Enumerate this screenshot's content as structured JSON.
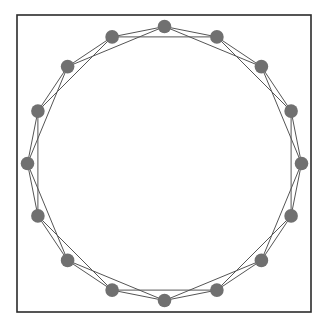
{
  "figure": {
    "title": "",
    "background_color": "#ffffff"
  },
  "frame": {
    "name": "plot-frame",
    "x": 17,
    "y": 15,
    "width": 294,
    "height": 297,
    "stroke_color": "#2b2b2b",
    "stroke_width": 1.6
  },
  "chart_data": {
    "type": "scatter",
    "title": "",
    "subtitle": "",
    "xlabel": "",
    "ylabel": "",
    "grid": false,
    "legend": null,
    "annotations": [],
    "graph_kind": "ring-lattice",
    "node_count": 16,
    "edge_count": 32,
    "neighbor_offsets": [
      1,
      2
    ],
    "degree": 4,
    "layout": {
      "kind": "circular",
      "center_x": 164.5,
      "center_y": 163.5,
      "radius": 137,
      "start_angle_deg": -90,
      "angle_step_deg": 22.5
    },
    "node_style": {
      "radius": 6.8,
      "fill": "#707070",
      "stroke": "none"
    },
    "edge_style": {
      "stroke": "#555555",
      "stroke_width": 1.0
    },
    "xlim": [
      17,
      311
    ],
    "ylim": [
      15,
      312
    ],
    "nodes": [
      {
        "id": 0,
        "label": "0",
        "angle_deg": -90.0,
        "x": 164.5,
        "y": 26.5
      },
      {
        "id": 1,
        "label": "1",
        "angle_deg": -67.5,
        "x": 216.9,
        "y": 36.9
      },
      {
        "id": 2,
        "label": "2",
        "angle_deg": -45.0,
        "x": 261.4,
        "y": 66.6
      },
      {
        "id": 3,
        "label": "3",
        "angle_deg": -22.5,
        "x": 291.1,
        "y": 111.1
      },
      {
        "id": 4,
        "label": "4",
        "angle_deg": 0.0,
        "x": 301.5,
        "y": 163.5
      },
      {
        "id": 5,
        "label": "5",
        "angle_deg": 22.5,
        "x": 291.1,
        "y": 215.9
      },
      {
        "id": 6,
        "label": "6",
        "angle_deg": 45.0,
        "x": 261.4,
        "y": 260.4
      },
      {
        "id": 7,
        "label": "7",
        "angle_deg": 67.5,
        "x": 216.9,
        "y": 290.1
      },
      {
        "id": 8,
        "label": "8",
        "angle_deg": 90.0,
        "x": 164.5,
        "y": 300.5
      },
      {
        "id": 9,
        "label": "9",
        "angle_deg": 112.5,
        "x": 112.1,
        "y": 290.1
      },
      {
        "id": 10,
        "label": "10",
        "angle_deg": 135.0,
        "x": 67.6,
        "y": 260.4
      },
      {
        "id": 11,
        "label": "11",
        "angle_deg": 157.5,
        "x": 37.9,
        "y": 215.9
      },
      {
        "id": 12,
        "label": "12",
        "angle_deg": 180.0,
        "x": 27.5,
        "y": 163.5
      },
      {
        "id": 13,
        "label": "13",
        "angle_deg": 202.5,
        "x": 37.9,
        "y": 111.1
      },
      {
        "id": 14,
        "label": "14",
        "angle_deg": 225.0,
        "x": 67.6,
        "y": 66.6
      },
      {
        "id": 15,
        "label": "15",
        "angle_deg": 247.5,
        "x": 112.1,
        "y": 36.9
      }
    ],
    "edges": [
      {
        "source": 0,
        "target": 1,
        "offset": 1
      },
      {
        "source": 1,
        "target": 2,
        "offset": 1
      },
      {
        "source": 2,
        "target": 3,
        "offset": 1
      },
      {
        "source": 3,
        "target": 4,
        "offset": 1
      },
      {
        "source": 4,
        "target": 5,
        "offset": 1
      },
      {
        "source": 5,
        "target": 6,
        "offset": 1
      },
      {
        "source": 6,
        "target": 7,
        "offset": 1
      },
      {
        "source": 7,
        "target": 8,
        "offset": 1
      },
      {
        "source": 8,
        "target": 9,
        "offset": 1
      },
      {
        "source": 9,
        "target": 10,
        "offset": 1
      },
      {
        "source": 10,
        "target": 11,
        "offset": 1
      },
      {
        "source": 11,
        "target": 12,
        "offset": 1
      },
      {
        "source": 12,
        "target": 13,
        "offset": 1
      },
      {
        "source": 13,
        "target": 14,
        "offset": 1
      },
      {
        "source": 14,
        "target": 15,
        "offset": 1
      },
      {
        "source": 15,
        "target": 0,
        "offset": 1
      },
      {
        "source": 0,
        "target": 2,
        "offset": 2
      },
      {
        "source": 1,
        "target": 3,
        "offset": 2
      },
      {
        "source": 2,
        "target": 4,
        "offset": 2
      },
      {
        "source": 3,
        "target": 5,
        "offset": 2
      },
      {
        "source": 4,
        "target": 6,
        "offset": 2
      },
      {
        "source": 5,
        "target": 7,
        "offset": 2
      },
      {
        "source": 6,
        "target": 8,
        "offset": 2
      },
      {
        "source": 7,
        "target": 9,
        "offset": 2
      },
      {
        "source": 8,
        "target": 10,
        "offset": 2
      },
      {
        "source": 9,
        "target": 11,
        "offset": 2
      },
      {
        "source": 10,
        "target": 12,
        "offset": 2
      },
      {
        "source": 11,
        "target": 13,
        "offset": 2
      },
      {
        "source": 12,
        "target": 14,
        "offset": 2
      },
      {
        "source": 13,
        "target": 15,
        "offset": 2
      },
      {
        "source": 14,
        "target": 0,
        "offset": 2
      },
      {
        "source": 15,
        "target": 1,
        "offset": 2
      }
    ]
  }
}
